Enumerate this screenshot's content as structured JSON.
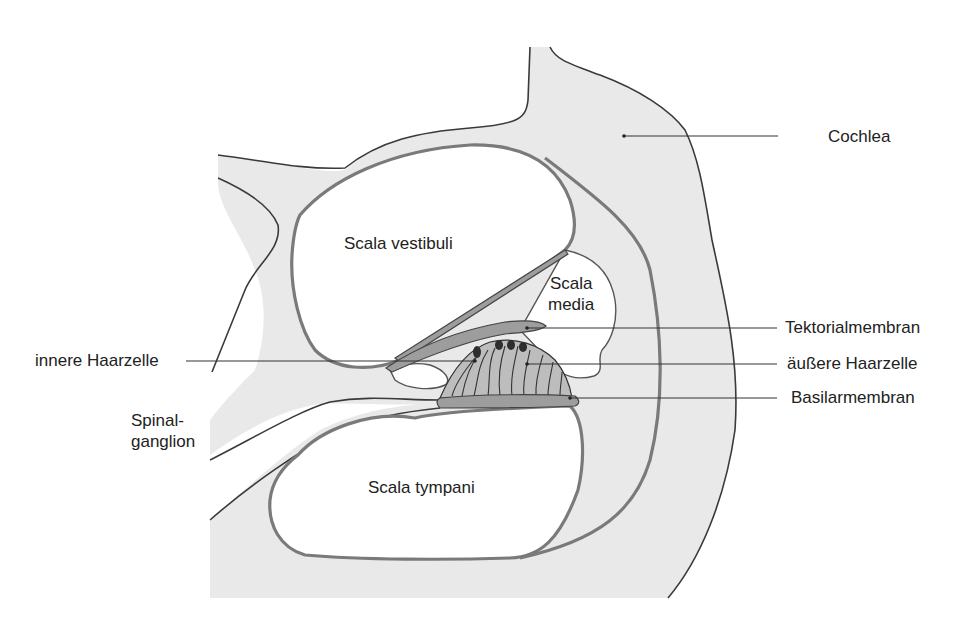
{
  "diagram": {
    "colors": {
      "tissue_fill": "#e9e9e9",
      "cavity_fill": "#ffffff",
      "membrane_fill": "#9d9d9d",
      "organ_fill": "#bdbdbd",
      "outline": "#3a3a3a",
      "text": "#222222"
    },
    "regions": {
      "scala_vestibuli": "Scala vestibuli",
      "scala_media_line1": "Scala",
      "scala_media_line2": "media",
      "scala_tympani": "Scala tympani"
    },
    "labels": {
      "cochlea": "Cochlea",
      "tektorialmembran": "Tektorialmembran",
      "aeussere_haarzelle": "äußere Haarzelle",
      "basilarmembran": "Basilarmembran",
      "innere_haarzelle": "innere Haarzelle",
      "spinalganglion_line1": "Spinal-",
      "spinalganglion_line2": "ganglion"
    }
  }
}
